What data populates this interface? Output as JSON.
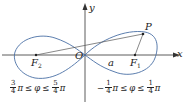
{
  "diagram": {
    "type": "lemniscate",
    "axes": {
      "x_label": "x",
      "y_label": "y"
    },
    "points": {
      "origin": "O",
      "focus_right": {
        "label": "F",
        "sub": "1"
      },
      "focus_left": {
        "label": "F",
        "sub": "2"
      },
      "point": "P"
    },
    "segment_label": "a",
    "ranges": {
      "left": {
        "neg": "",
        "n1": "3",
        "d1": "4",
        "var": "φ",
        "n2": "5",
        "d2": "4",
        "pi": "π",
        "le": "≤"
      },
      "right": {
        "neg": "−",
        "n1": "1",
        "d1": "4",
        "var": "φ",
        "n2": "1",
        "d2": "4",
        "pi": "π",
        "le": "≤"
      }
    },
    "colors": {
      "curve": "#4a6fa5",
      "axes": "#333333",
      "lines": "#555555"
    }
  }
}
